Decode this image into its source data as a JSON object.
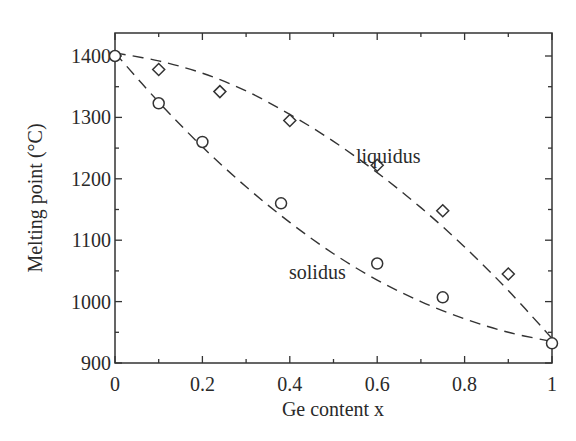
{
  "chart_data": {
    "type": "scatter",
    "title": "",
    "xlabel": "Ge content x",
    "ylabel": "Melting point (°C)",
    "xlim": [
      0,
      1
    ],
    "ylim": [
      900,
      1420
    ],
    "grid": false,
    "legend": null,
    "x_ticks": [
      0,
      0.2,
      0.4,
      0.6,
      0.8,
      1
    ],
    "x_tick_labels": [
      "0",
      "0.2",
      "0.4",
      "0.6",
      "0.8",
      "1"
    ],
    "x_minor_ticks": [
      0.1,
      0.3,
      0.5,
      0.7,
      0.9
    ],
    "y_ticks": [
      900,
      1000,
      1100,
      1200,
      1300,
      1400
    ],
    "y_tick_labels": [
      "900",
      "1000",
      "1100",
      "1200",
      "1300",
      "1400"
    ],
    "y_minor_ticks": [
      950,
      1050,
      1150,
      1250,
      1350
    ],
    "series": [
      {
        "name": "solidus",
        "marker": "circle",
        "x": [
          0,
          0.1,
          0.2,
          0.38,
          0.6,
          0.75,
          1.0
        ],
        "y": [
          1400,
          1323,
          1260,
          1160,
          1062,
          1007,
          932
        ]
      },
      {
        "name": "liquidus",
        "marker": "diamond",
        "x": [
          0.1,
          0.24,
          0.4,
          0.6,
          0.75,
          0.9
        ],
        "y": [
          1378,
          1342,
          1295,
          1222,
          1148,
          1045
        ]
      }
    ],
    "fit_curves": [
      {
        "name": "solidus-fit",
        "style": "dashed",
        "x": [
          0,
          0.1,
          0.2,
          0.3,
          0.4,
          0.5,
          0.6,
          0.7,
          0.8,
          0.9,
          1.0
        ],
        "y": [
          1405,
          1325,
          1252,
          1187,
          1129,
          1078,
          1035,
          1000,
          972,
          950,
          935
        ]
      },
      {
        "name": "liquidus-fit",
        "style": "dashed",
        "x": [
          0,
          0.1,
          0.2,
          0.3,
          0.4,
          0.5,
          0.6,
          0.7,
          0.8,
          0.9,
          1.0
        ],
        "y": [
          1405,
          1392,
          1372,
          1343,
          1305,
          1261,
          1210,
          1153,
          1089,
          1018,
          940
        ]
      }
    ],
    "annotations": [
      {
        "text": "liquidus",
        "x": 0.63,
        "y": 1285
      },
      {
        "text": "solidus",
        "x": 0.45,
        "y": 1048
      }
    ]
  },
  "labels": {
    "xlabel": "Ge content x",
    "ylabel": "Melting point (°C)",
    "liquidus": "liquidus",
    "solidus": "solidus"
  }
}
